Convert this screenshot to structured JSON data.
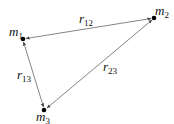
{
  "diagram": {
    "nodes": [
      {
        "id": "m1",
        "label": "m",
        "sub": "1",
        "x": 23,
        "y": 39
      },
      {
        "id": "m2",
        "label": "m",
        "sub": "2",
        "x": 154,
        "y": 18
      },
      {
        "id": "m3",
        "label": "m",
        "sub": "3",
        "x": 44,
        "y": 110
      }
    ],
    "edges": [
      {
        "id": "r12",
        "label": "r",
        "sub": "12",
        "from": "m1",
        "to": "m2"
      },
      {
        "id": "r13",
        "label": "r",
        "sub": "13",
        "from": "m1",
        "to": "m3"
      },
      {
        "id": "r23",
        "label": "r",
        "sub": "23",
        "from": "m2",
        "to": "m3"
      }
    ],
    "colors": {
      "line": "#555555",
      "dot": "#000000",
      "text": "#111111"
    }
  }
}
